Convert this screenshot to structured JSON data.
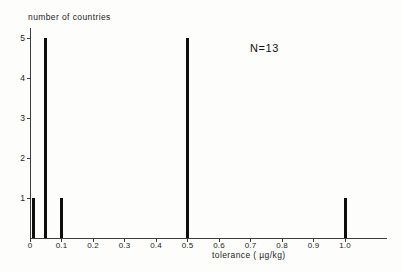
{
  "chart_data": {
    "type": "bar",
    "title": "",
    "ylabel": "number of countries",
    "xlabel": "tolerance ( µg/kg)",
    "annotation": "N=13",
    "x": [
      0.01,
      0.05,
      0.1,
      0.5,
      1.0
    ],
    "values": [
      1,
      5,
      1,
      5,
      1
    ],
    "total_n": 13,
    "xlim": [
      0,
      1.13
    ],
    "ylim": [
      0,
      5.25
    ],
    "grid": false,
    "legend": "none",
    "xticks": [
      {
        "v": 0.0,
        "label": "0"
      },
      {
        "v": 0.1,
        "label": "0.1"
      },
      {
        "v": 0.2,
        "label": "0.2"
      },
      {
        "v": 0.3,
        "label": "0.3"
      },
      {
        "v": 0.4,
        "label": "0.4"
      },
      {
        "v": 0.5,
        "label": "0.5"
      },
      {
        "v": 0.6,
        "label": "0.6"
      },
      {
        "v": 0.7,
        "label": "0.7"
      },
      {
        "v": 0.8,
        "label": "0.8"
      },
      {
        "v": 0.9,
        "label": "0.9"
      },
      {
        "v": 1.0,
        "label": "1.0"
      }
    ],
    "yticks": [
      {
        "v": 1,
        "label": "1"
      },
      {
        "v": 2,
        "label": "2"
      },
      {
        "v": 3,
        "label": "3"
      },
      {
        "v": 4,
        "label": "4"
      },
      {
        "v": 5,
        "label": "5"
      }
    ]
  }
}
